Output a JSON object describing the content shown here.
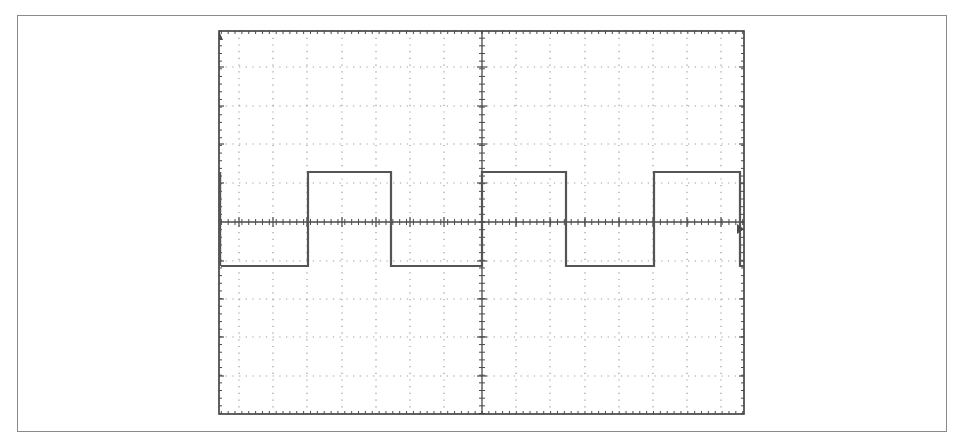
{
  "chart_data": {
    "type": "line",
    "title": "",
    "subtitle": "",
    "xlabel": "",
    "ylabel": "",
    "grid": true,
    "legend": null,
    "x_divisions": 10,
    "y_divisions": 10,
    "xlim": [
      0,
      10
    ],
    "ylim": [
      -5,
      5
    ],
    "series": [
      {
        "name": "square-wave",
        "x": [
          0,
          2.55,
          2.55,
          4.95,
          4.95,
          7.6,
          7.6,
          10.05,
          10.05,
          12.6,
          12.6,
          15.1,
          15.1
        ],
        "values": [
          -1.15,
          -1.15,
          1.3,
          1.3,
          -1.15,
          -1.15,
          1.3,
          1.3,
          -1.15,
          -1.15,
          1.3,
          1.3,
          -1.15
        ],
        "unit_x": "div",
        "unit_y": "div"
      }
    ],
    "wave": {
      "shape": "square",
      "high_level_div": 1.3,
      "low_level_div": -1.15,
      "period_div": 5.0,
      "duty_cycle": 0.48
    },
    "markers": {
      "trigger_level_arrow": "right-edge",
      "channel_ground_arrow": "left-top"
    }
  },
  "display": {
    "colors": {
      "background": "#ffffff",
      "frame": "#8a8a8a",
      "graticule_border": "#3a3a3a",
      "grid_dots": "#9a9a9a",
      "axis": "#4a4a4a",
      "trace": "#555555"
    },
    "screen": {
      "left": 219,
      "top": 31,
      "right": 744,
      "bottom": 414,
      "center_x": 482,
      "center_y": 222
    },
    "vertical_gridlines_x": [
      239,
      273,
      307,
      342,
      376,
      410,
      444,
      516,
      550,
      585,
      619,
      653,
      687,
      721
    ],
    "horizontal_gridlines_y": [
      67,
      106,
      144,
      183,
      261,
      299,
      337,
      376
    ],
    "trace_points": [
      [
        221,
        266
      ],
      [
        308,
        266
      ],
      [
        308,
        172
      ],
      [
        391,
        172
      ],
      [
        391,
        266
      ],
      [
        482,
        266
      ],
      [
        482,
        172
      ],
      [
        566,
        172
      ],
      [
        566,
        266
      ],
      [
        654,
        266
      ],
      [
        654,
        172
      ],
      [
        740,
        172
      ],
      [
        740,
        266
      ],
      [
        744,
        266
      ]
    ],
    "left_edge_trace": {
      "x": 220,
      "y1": 172,
      "y2": 266
    }
  }
}
